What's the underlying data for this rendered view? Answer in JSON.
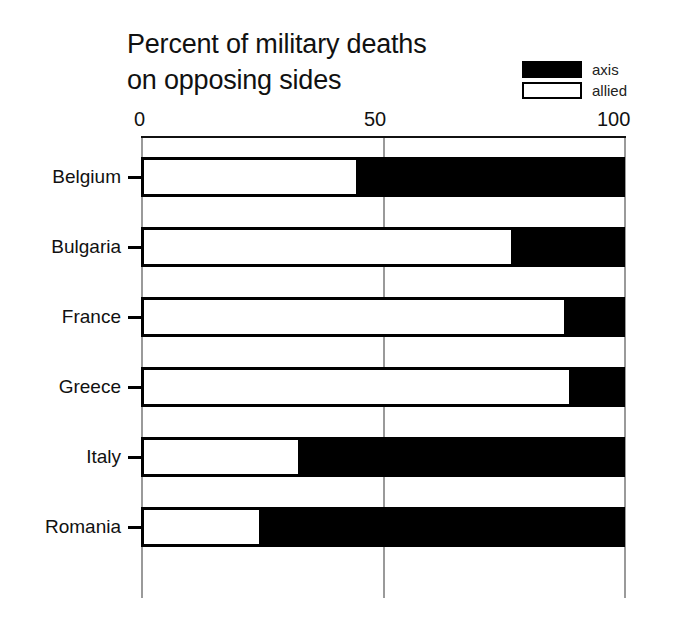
{
  "chart_data": {
    "type": "bar",
    "orientation": "horizontal",
    "stacked": true,
    "title": "Percent of military deaths\non opposing sides",
    "xlabel": "",
    "ylabel": "",
    "xlim": [
      0,
      100
    ],
    "xticks": [
      0,
      50,
      100
    ],
    "xtick_labels": [
      "0",
      "50",
      "100"
    ],
    "grid": true,
    "grid_axis": "x",
    "legend_position": "top-right",
    "categories": [
      "Belgium",
      "Bulgaria",
      "France",
      "Greece",
      "Italy",
      "Romania"
    ],
    "series": [
      {
        "name": "allied",
        "color": "#ffffff",
        "values": [
          45,
          77,
          88,
          89,
          33,
          25
        ]
      },
      {
        "name": "axis",
        "color": "#000000",
        "values": [
          55,
          23,
          12,
          11,
          67,
          75
        ]
      }
    ]
  },
  "legend": {
    "items": [
      {
        "label": "axis",
        "swatch": "black-filled-rect"
      },
      {
        "label": "allied",
        "swatch": "white-outlined-rect"
      }
    ]
  },
  "colors": {
    "axis_fill": "#000000",
    "allied_fill": "#ffffff",
    "outline": "#000000",
    "gridline": "#9a9a9a",
    "text": "#111111",
    "background": "#ffffff"
  }
}
